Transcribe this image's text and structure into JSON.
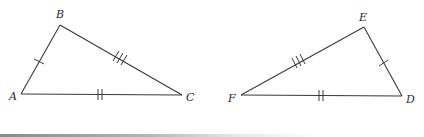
{
  "figure": {
    "triangles": [
      {
        "name": "ABC",
        "vertices": {
          "A": {
            "label": "A",
            "x": 21,
            "y": 94
          },
          "B": {
            "label": "B",
            "x": 60,
            "y": 25
          },
          "C": {
            "label": "C",
            "x": 182,
            "y": 95
          }
        },
        "sides": [
          {
            "segment": "AB",
            "ticks": 1
          },
          {
            "segment": "BC",
            "ticks": 3
          },
          {
            "segment": "AC",
            "ticks": 2
          }
        ]
      },
      {
        "name": "DEF",
        "vertices": {
          "D": {
            "label": "D",
            "x": 402,
            "y": 96
          },
          "E": {
            "label": "E",
            "x": 364,
            "y": 27
          },
          "F": {
            "label": "F",
            "x": 241,
            "y": 95
          }
        },
        "sides": [
          {
            "segment": "DE",
            "ticks": 1
          },
          {
            "segment": "EF",
            "ticks": 3
          },
          {
            "segment": "FD",
            "ticks": 2
          }
        ]
      }
    ],
    "colors": {
      "stroke": "#3a3a3a",
      "label": "#2a2a2a",
      "background": "#ffffff"
    }
  }
}
